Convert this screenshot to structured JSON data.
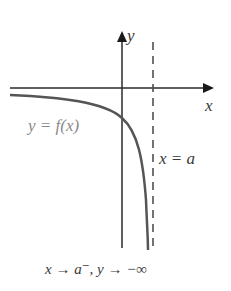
{
  "diagram": {
    "axes": {
      "x_label": "x",
      "y_label": "y"
    },
    "curve_label": "y = f(x)",
    "asymptote_label": "x = a",
    "caption": "x → a⁻, y → −∞",
    "colors": {
      "axes": "#2a2a2a",
      "curve": "#555555",
      "curve_label": "#8a8a8a",
      "asymptote": "#444444",
      "background": "#ffffff"
    }
  }
}
